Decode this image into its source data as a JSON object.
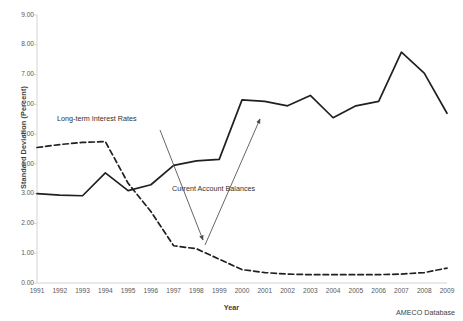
{
  "chart_data": {
    "type": "line",
    "title": "",
    "xlabel": "Year",
    "ylabel": "Standard Deviation (Percent)",
    "xlim": [
      1991,
      2009
    ],
    "ylim": [
      0.0,
      9.0
    ],
    "ytick_step": 1.0,
    "grid": false,
    "legend_position": "none",
    "source_note": "AMECO Database",
    "categories": [
      1991,
      1992,
      1993,
      1994,
      1995,
      1996,
      1997,
      1998,
      1999,
      2000,
      2001,
      2002,
      2003,
      2004,
      2005,
      2006,
      2007,
      2008,
      2009
    ],
    "xtick_labels": [
      "1991",
      "1992",
      "1993",
      "1994",
      "1995",
      "1996",
      "1997",
      "1998",
      "1999",
      "2000",
      "2001",
      "2002",
      "2003",
      "2004",
      "2005",
      "2006",
      "2007",
      "2008",
      "2009"
    ],
    "ytick_labels": [
      "0.00",
      "1.00",
      "2.00",
      "3.00",
      "4.00",
      "5.00",
      "6.00",
      "7.00",
      "8.00",
      "9.00"
    ],
    "series": [
      {
        "name": "Current Account Balances",
        "style": "solid",
        "color": "#231f20",
        "values": [
          3.0,
          2.95,
          2.93,
          3.7,
          3.1,
          3.3,
          3.95,
          4.1,
          4.15,
          6.15,
          6.1,
          5.95,
          6.3,
          5.55,
          5.95,
          6.1,
          7.75,
          7.05,
          5.7
        ]
      },
      {
        "name": "Long-term Interest Rates",
        "style": "dashed",
        "color": "#231f20",
        "values": [
          4.55,
          4.65,
          4.72,
          4.75,
          3.35,
          2.4,
          1.25,
          1.15,
          0.8,
          0.45,
          0.35,
          0.3,
          0.28,
          0.28,
          0.28,
          0.28,
          0.3,
          0.35,
          0.5
        ]
      }
    ],
    "annotations": [
      {
        "id": "long-term-interest-rates",
        "text": "Long-term Interest Rates",
        "arrow_from": {
          "x": 160,
          "y": 130
        },
        "arrow_to": {
          "x": 203,
          "y": 240
        }
      },
      {
        "id": "current-account-balances",
        "text": "Current Account Balances",
        "arrow_from": {
          "x": 205,
          "y": 245
        },
        "arrow_to": {
          "x": 260,
          "y": 119
        }
      }
    ]
  },
  "geometry": {
    "axis_left": 37,
    "axis_right": 447,
    "axis_top": 15,
    "axis_bottom": 283
  }
}
